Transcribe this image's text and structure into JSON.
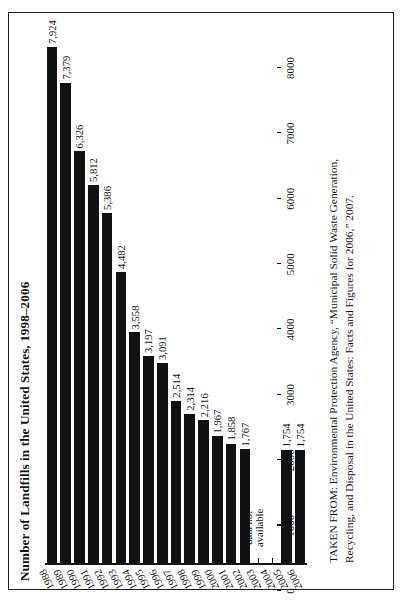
{
  "figure": {
    "title": "Number of Landfills in the United States, 1998–2006",
    "gap_note_line1": "data not",
    "gap_note_line2": "available",
    "source_line1": "TAKEN FROM: Environmental Protection Agency, “Municipal Solid Waste Generation,",
    "source_line2": "Recycling, and Disposal in the United States: Facts and Figures for 2006,” 2007.",
    "ink_color": "#111111",
    "background_color": "#ffffff"
  },
  "chart_data": {
    "type": "bar",
    "orientation": "horizontal",
    "title": "Number of Landfills in the United States, 1998–2006",
    "xlabel": "",
    "ylabel": "",
    "grid": false,
    "legend": "none",
    "ylim": [
      0,
      8000
    ],
    "tick_labels": [
      "0",
      "1000",
      "2000",
      "3000",
      "4000",
      "5000",
      "6000",
      "7000",
      "8000"
    ],
    "tick_values": [
      0,
      1000,
      2000,
      3000,
      4000,
      5000,
      6000,
      7000,
      8000
    ],
    "categories": [
      "1988",
      "1989",
      "1990",
      "1991",
      "1992",
      "1993",
      "1994",
      "1995",
      "1996",
      "1997",
      "1998",
      "1999",
      "2000",
      "2001",
      "2002",
      "2003",
      "2004",
      "2005",
      "2006"
    ],
    "values": [
      7924,
      7379,
      6326,
      5812,
      5386,
      4482,
      3558,
      3197,
      3091,
      2514,
      2314,
      2216,
      1967,
      1858,
      1767,
      null,
      null,
      1754,
      1754
    ],
    "value_labels": [
      "7,924",
      "7,379",
      "6,326",
      "5,812",
      "5,386",
      "4,482",
      "3,558",
      "3,197",
      "3,091",
      "2,514",
      "2,314",
      "2,216",
      "1,967",
      "1,858",
      "1,767",
      "",
      "",
      "1,754",
      "1,754"
    ],
    "missing_categories": [
      "2003",
      "2004"
    ],
    "missing_note": "data not available"
  }
}
